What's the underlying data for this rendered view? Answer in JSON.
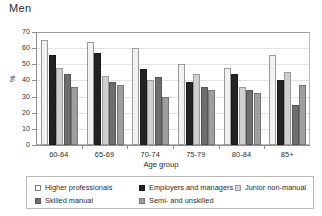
{
  "chart_data": {
    "type": "bar",
    "title": "Men",
    "xlabel": "Age group",
    "ylabel": "%",
    "ylim": [
      0,
      70
    ],
    "yticks": [
      0,
      10,
      20,
      30,
      40,
      50,
      60,
      70
    ],
    "grid": true,
    "legend_position": "bottom",
    "categories": [
      "60-64",
      "65-69",
      "70-74",
      "75-79",
      "80-84",
      "85+"
    ],
    "series": [
      {
        "name": "Higher professionals",
        "color": "#f1f1f1",
        "values": [
          65,
          64,
          60,
          50,
          48,
          56
        ]
      },
      {
        "name": "Employers and managers",
        "color": "#232323",
        "values": [
          56,
          57,
          47,
          39,
          44,
          40
        ]
      },
      {
        "name": "Junior non-manual",
        "color": "#cfcfcf",
        "values": [
          48,
          43,
          40,
          44,
          36,
          45
        ]
      },
      {
        "name": "Skilled manual",
        "color": "#6e6e6e",
        "values": [
          44,
          39,
          42,
          36,
          34,
          25
        ]
      },
      {
        "name": "Semi- and unskilled",
        "color": "#9e9e9e",
        "values": [
          36,
          37,
          30,
          34,
          32,
          37
        ]
      }
    ]
  },
  "legend": {
    "items": [
      {
        "label": "Higher professionals"
      },
      {
        "label": "Employers and managers"
      },
      {
        "label": "Junior non-manual"
      },
      {
        "label": "Skilled manual"
      },
      {
        "label": "Semi- and unskilled"
      }
    ]
  }
}
